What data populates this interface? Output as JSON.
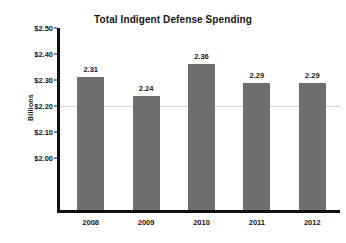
{
  "chart_data": {
    "type": "bar",
    "title": "Total Indigent Defense Spending",
    "xlabel": "",
    "ylabel": "Billions",
    "categories": [
      "2008",
      "2009",
      "2010",
      "2011",
      "2012"
    ],
    "values": [
      2.31,
      2.24,
      2.36,
      2.29,
      2.29
    ],
    "value_labels": [
      "2.31",
      "2.24",
      "2.36",
      "2.29",
      "2.29"
    ],
    "ylim": [
      1.8,
      2.5
    ],
    "yticks": [
      2.5,
      2.4,
      2.3,
      2.2,
      2.1,
      2.0
    ],
    "ytick_labels": [
      "$2.50",
      "$2.40",
      "$2.30",
      "$2.20",
      "$2.10",
      "$2.00"
    ],
    "grid": "single faint gridline at 2.20",
    "gridlines": [
      2.2
    ],
    "legend": null,
    "legend_position": "none",
    "bar_color": "#6e6e6e",
    "axis_color": "#111111",
    "text_color": "#161616",
    "background_color": "#ffffff"
  }
}
